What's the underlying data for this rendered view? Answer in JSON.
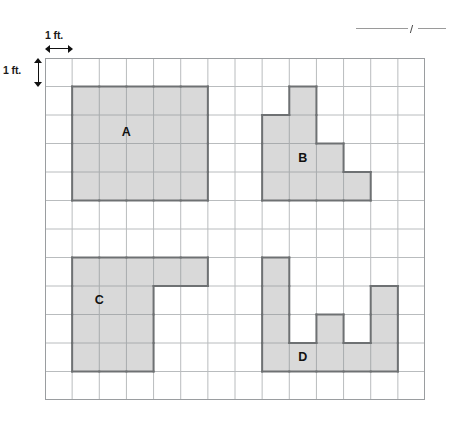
{
  "top_rule": {
    "name": "decorative-rule",
    "tick_mark": "/"
  },
  "scale": {
    "horizontal_label": "1 ft.",
    "vertical_label": "1 ft."
  },
  "grid": {
    "columns": 14,
    "rows": 12,
    "cell_px": 27.15,
    "row_px": 28.5,
    "line_color": "#b9bcbe",
    "border_color": "#9a9da0",
    "fill_color": "#d9d9d9",
    "outline_color": "#6e7173"
  },
  "shapes": [
    {
      "label": "A",
      "label_col": 3.0,
      "label_row": 2.6,
      "cells": [
        [
          1,
          1
        ],
        [
          2,
          1
        ],
        [
          3,
          1
        ],
        [
          4,
          1
        ],
        [
          5,
          1
        ],
        [
          1,
          2
        ],
        [
          2,
          2
        ],
        [
          3,
          2
        ],
        [
          4,
          2
        ],
        [
          5,
          2
        ],
        [
          1,
          3
        ],
        [
          2,
          3
        ],
        [
          3,
          3
        ],
        [
          4,
          3
        ],
        [
          5,
          3
        ],
        [
          1,
          4
        ],
        [
          2,
          4
        ],
        [
          3,
          4
        ],
        [
          4,
          4
        ],
        [
          5,
          4
        ]
      ]
    },
    {
      "label": "B",
      "label_col": 9.5,
      "label_row": 3.5,
      "cells": [
        [
          9,
          1
        ],
        [
          8,
          2
        ],
        [
          9,
          2
        ],
        [
          8,
          3
        ],
        [
          9,
          3
        ],
        [
          10,
          3
        ],
        [
          8,
          4
        ],
        [
          9,
          4
        ],
        [
          10,
          4
        ],
        [
          11,
          4
        ]
      ]
    },
    {
      "label": "C",
      "label_col": 2.0,
      "label_row": 8.5,
      "cells": [
        [
          1,
          7
        ],
        [
          2,
          7
        ],
        [
          3,
          7
        ],
        [
          4,
          7
        ],
        [
          5,
          7
        ],
        [
          1,
          8
        ],
        [
          2,
          8
        ],
        [
          3,
          8
        ],
        [
          1,
          9
        ],
        [
          2,
          9
        ],
        [
          3,
          9
        ],
        [
          1,
          10
        ],
        [
          2,
          10
        ],
        [
          3,
          10
        ]
      ]
    },
    {
      "label": "D",
      "label_col": 9.5,
      "label_row": 10.5,
      "cells": [
        [
          8,
          7
        ],
        [
          8,
          8
        ],
        [
          12,
          8
        ],
        [
          8,
          9
        ],
        [
          10,
          9
        ],
        [
          12,
          9
        ],
        [
          8,
          10
        ],
        [
          9,
          10
        ],
        [
          10,
          10
        ],
        [
          11,
          10
        ],
        [
          12,
          10
        ]
      ]
    }
  ]
}
